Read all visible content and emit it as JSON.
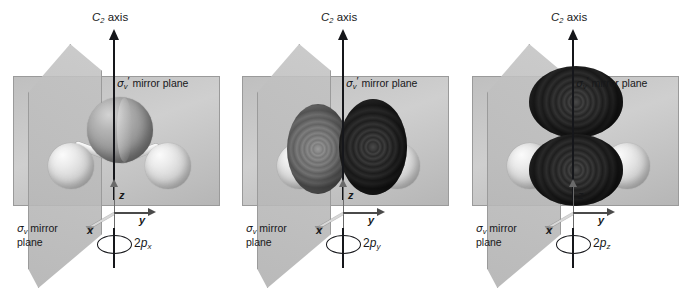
{
  "figure": {
    "molecule": "H2O",
    "symmetry_point_group": "C2v",
    "background_color": "#ffffff"
  },
  "labels": {
    "c2_axis": "C",
    "c2_axis_sub": "2",
    "c2_axis_word": " axis",
    "sigma_v_prime_plane": " mirror plane",
    "sigma_glyph": "σ",
    "sigma_sub": "v",
    "prime_glyph": "′",
    "sigma_v_plane_line1": " mirror",
    "sigma_v_plane_line2": "plane",
    "axis_x": "x",
    "axis_y": "y",
    "axis_z": "z"
  },
  "panels": [
    {
      "id": "panel-1",
      "orbital_prefix": "2",
      "orbital_letter": "p",
      "orbital_sub": "x",
      "orbital_full": "2px",
      "c2_axis_label": "C2 axis",
      "sigma_v_prime_label": "σv′ mirror plane",
      "sigma_v_label": "σv mirror plane",
      "axes": [
        "x",
        "y",
        "z"
      ],
      "shows_orbital": false,
      "atoms": [
        {
          "element": "O",
          "role": "central-atom"
        },
        {
          "element": "H",
          "role": "left-hydrogen"
        },
        {
          "element": "H",
          "role": "right-hydrogen"
        }
      ],
      "description": "Water molecule with C2 axis and two vertical mirror planes; 2px orbital is perpendicular to the molecular plane."
    },
    {
      "id": "panel-2",
      "orbital_prefix": "2",
      "orbital_letter": "p",
      "orbital_sub": "y",
      "orbital_full": "2py",
      "c2_axis_label": "C2 axis",
      "sigma_v_prime_label": "σv′ mirror plane",
      "sigma_v_label": "σv mirror plane",
      "axes": [
        "x",
        "y",
        "z"
      ],
      "shows_orbital": true,
      "lobe_orientation": "horizontal",
      "lobe_left_shade": "mid-gray",
      "lobe_right_shade": "dark",
      "atoms": [
        {
          "element": "O",
          "role": "central-atom"
        },
        {
          "element": "H",
          "role": "left-hydrogen"
        },
        {
          "element": "H",
          "role": "right-hydrogen"
        }
      ],
      "description": "2py orbital lobes lie along the y axis, in the molecular plane."
    },
    {
      "id": "panel-3",
      "orbital_prefix": "2",
      "orbital_letter": "p",
      "orbital_sub": "z",
      "orbital_full": "2pz",
      "c2_axis_label": "C2 axis",
      "sigma_v_prime_label": "σv′ mirror plane",
      "sigma_v_label": "σv mirror plane",
      "axes": [
        "x",
        "y",
        "z"
      ],
      "shows_orbital": true,
      "lobe_orientation": "vertical",
      "lobe_top_shade": "dark",
      "lobe_bottom_shade": "dark",
      "atoms": [
        {
          "element": "O",
          "role": "central-atom"
        },
        {
          "element": "H",
          "role": "left-hydrogen"
        },
        {
          "element": "H",
          "role": "right-hydrogen"
        }
      ],
      "description": "2pz orbital lobes lie along the z axis, coincident with the C2 axis."
    }
  ],
  "colors": {
    "plane_fill": "#c2c2c2",
    "plane_edge": "#9a9a9a",
    "axis_dark": "#15161a",
    "axis_gray": "#6a6a6a",
    "lobe_dark": "#232323",
    "lobe_mid": "#757575",
    "atom_oxygen": "#9a9a9a",
    "atom_hydrogen": "#dcdcdc"
  }
}
